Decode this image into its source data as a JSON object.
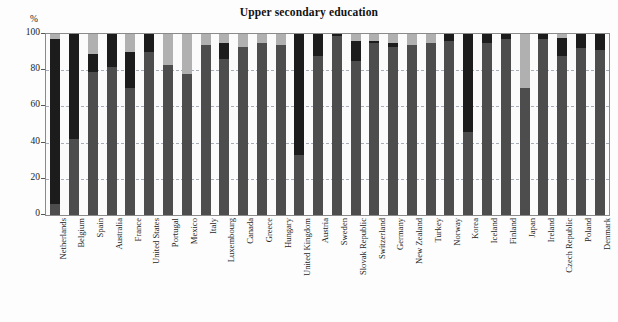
{
  "chart": {
    "title": "Upper secondary education",
    "yaxis_unit": "%"
  },
  "chart_data": {
    "type": "bar",
    "subtype": "stacked-bar-vertical",
    "title": "Upper secondary education",
    "xlabel": "",
    "ylabel": "%",
    "ylim": [
      0,
      100
    ],
    "yticks": [
      0,
      20,
      40,
      60,
      80,
      100
    ],
    "grid": true,
    "legend": "none",
    "stacked": true,
    "stack_total": 100,
    "colors": {
      "segment_lower": "#4d4d4d",
      "segment_middle": "#1c1c1c",
      "segment_upper": "#b0b0b0",
      "plot_background": "#fbfbfb",
      "gridline": "#9aa0b0",
      "axis": "#8a8a8a"
    },
    "series": [
      {
        "name": "lower-segment",
        "color": "#4d4d4d",
        "values": [
          6,
          42,
          79,
          82,
          70,
          90,
          83,
          78,
          94,
          86,
          93,
          95,
          94,
          33,
          88,
          99,
          85,
          95,
          93,
          94,
          95,
          96,
          46,
          95,
          97,
          70,
          97,
          88,
          92,
          91
        ]
      },
      {
        "name": "middle-segment",
        "color": "#1c1c1c",
        "values": [
          91,
          58,
          10,
          18,
          20,
          10,
          0,
          0,
          0,
          9,
          0,
          0,
          0,
          67,
          12,
          1,
          11,
          1,
          2,
          0,
          0,
          4,
          54,
          5,
          3,
          0,
          3,
          10,
          8,
          9
        ]
      },
      {
        "name": "upper-segment",
        "color": "#b0b0b0",
        "values": [
          3,
          0,
          11,
          0,
          10,
          0,
          17,
          22,
          6,
          5,
          7,
          5,
          6,
          0,
          0,
          0,
          4,
          4,
          5,
          6,
          5,
          0,
          0,
          0,
          0,
          30,
          0,
          2,
          0,
          0
        ]
      }
    ],
    "categories": [
      "Netherlands",
      "Belgium",
      "Spain",
      "Australia",
      "France",
      "United States",
      "Portugal",
      "Mexico",
      "Italy",
      "Luxembourg",
      "Canada",
      "Greece",
      "Hungary",
      "United Kingdom",
      "Austria",
      "Sweden",
      "Slovak Republic",
      "Switzerland",
      "Germany",
      "New Zealand",
      "Turkey",
      "Norway",
      "Korea",
      "Iceland",
      "Finland",
      "Japan",
      "Ireland",
      "Czech Republic",
      "Poland",
      "Denmark"
    ]
  }
}
